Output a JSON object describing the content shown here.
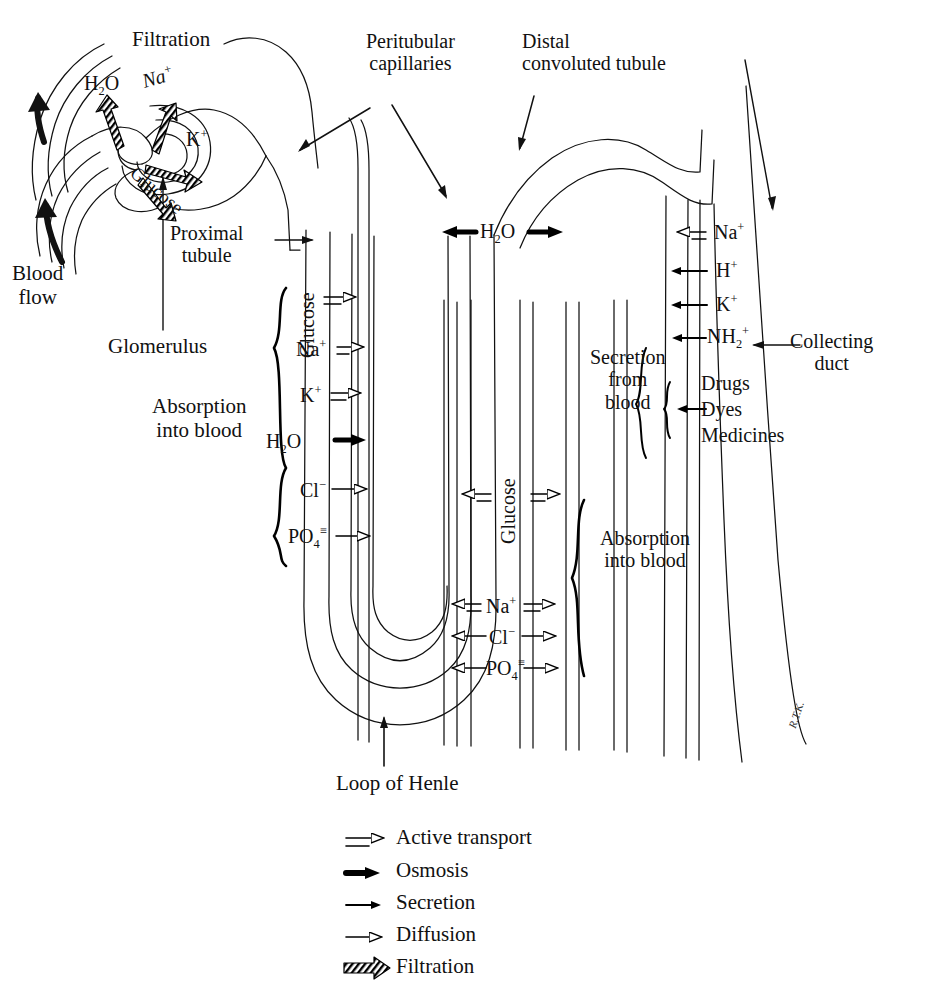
{
  "diagram": {
    "type": "labeled-anatomical-diagram"
  },
  "labels": {
    "filtration": "Filtration",
    "peritubular_capillaries": "Peritubular\ncapillaries",
    "distal_convoluted_tubule": "Distal\nconvoluted tubule",
    "blood_flow": "Blood\nflow",
    "glomerulus": "Glomerulus",
    "proximal_tubule": "Proximal\ntubule",
    "absorption_into_blood_upper": "Absorption\ninto blood",
    "absorption_into_blood_lower": "Absorption\ninto blood",
    "secretion_from_blood": "Secretion\nfrom\nblood",
    "collecting_duct": "Collecting\nduct",
    "loop_of_henle": "Loop of Henle",
    "signature": "R.T.K."
  },
  "glomerulus_substances": [
    {
      "name": "H2O",
      "html": "H<sub>2</sub>O",
      "transport": "filtration"
    },
    {
      "name": "Na+",
      "html": "Na<sup>+</sup>",
      "transport": "filtration"
    },
    {
      "name": "K+",
      "html": "K<sup>+</sup>",
      "transport": "filtration"
    },
    {
      "name": "Glucose",
      "html": "Glucose",
      "transport": "filtration"
    }
  ],
  "proximal_tubule_substances": [
    {
      "name": "Glucose",
      "html": "Glucose",
      "transport": "active transport",
      "direction": "right"
    },
    {
      "name": "Na+",
      "html": "Na<sup>+</sup>",
      "transport": "active transport",
      "direction": "right"
    },
    {
      "name": "K+",
      "html": "K<sup>+</sup>",
      "transport": "active transport",
      "direction": "right"
    },
    {
      "name": "H2O",
      "html": "H<sub>2</sub>O",
      "transport": "osmosis",
      "direction": "right"
    },
    {
      "name": "Cl-",
      "html": "Cl<sup>&minus;</sup>",
      "transport": "diffusion",
      "direction": "right"
    },
    {
      "name": "PO4=",
      "html": "PO<sub>4</sub><sup>&#8801;</sup>",
      "transport": "diffusion",
      "direction": "right"
    }
  ],
  "loop_substances": [
    {
      "name": "H2O",
      "html": "H<sub>2</sub>O",
      "transport": "osmosis",
      "direction": "both"
    },
    {
      "name": "Glucose",
      "html": "Glucose",
      "transport": "active transport",
      "direction": "both"
    },
    {
      "name": "Na+",
      "html": "Na<sup>+</sup>",
      "transport": "active transport",
      "direction": "both"
    },
    {
      "name": "Cl-",
      "html": "Cl<sup>&minus;</sup>",
      "transport": "diffusion",
      "direction": "both"
    },
    {
      "name": "PO4=",
      "html": "PO<sub>4</sub><sup>&#8801;</sup>",
      "transport": "diffusion",
      "direction": "both"
    }
  ],
  "collecting_duct_substances": [
    {
      "name": "Na+",
      "html": "Na<sup>+</sup>",
      "transport": "active transport",
      "direction": "left"
    },
    {
      "name": "H+",
      "html": "H<sup>+</sup>",
      "transport": "secretion",
      "direction": "left"
    },
    {
      "name": "K+",
      "html": "K<sup>+</sup>",
      "transport": "secretion",
      "direction": "left"
    },
    {
      "name": "NH2+",
      "html": "NH<sub>2</sub><sup>+</sup>",
      "transport": "secretion",
      "direction": "left"
    },
    {
      "name": "Drugs",
      "html": "Drugs",
      "transport": "secretion",
      "direction": "left"
    },
    {
      "name": "Dyes",
      "html": "Dyes",
      "transport": "secretion",
      "direction": "left"
    },
    {
      "name": "Medicines",
      "html": "Medicines",
      "transport": "secretion",
      "direction": "left"
    }
  ],
  "legend": {
    "items": [
      {
        "key": "active-transport",
        "label": "Active transport"
      },
      {
        "key": "osmosis",
        "label": "Osmosis"
      },
      {
        "key": "secretion",
        "label": "Secretion"
      },
      {
        "key": "diffusion",
        "label": "Diffusion"
      },
      {
        "key": "filtration",
        "label": "Filtration"
      }
    ]
  },
  "colors": {
    "ink": "#000000",
    "paper": "#ffffff"
  }
}
